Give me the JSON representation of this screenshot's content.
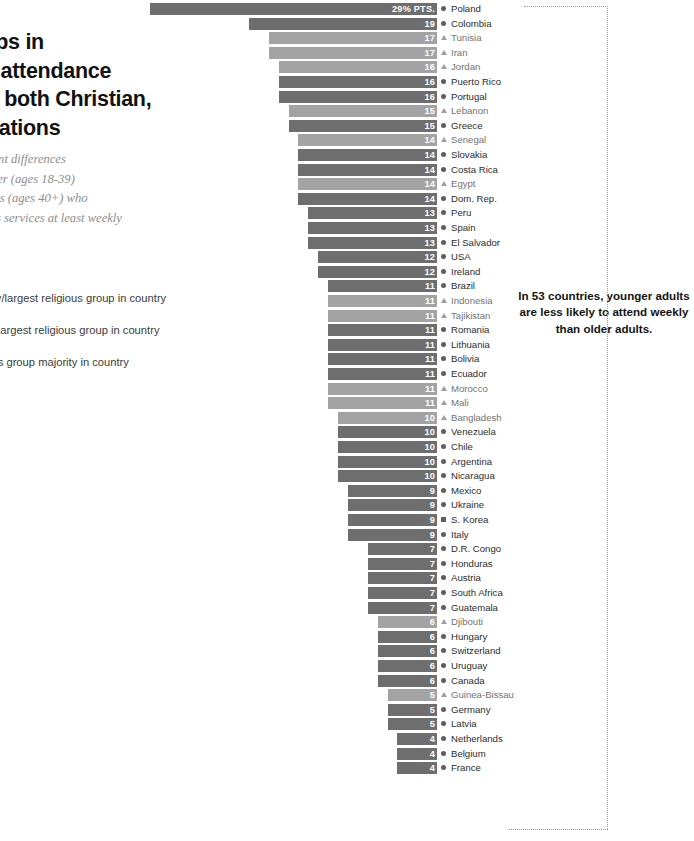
{
  "headline": {
    "title": "Large gaps in\nreligious attendance\nby age in both Christian,\nMuslim nations",
    "subtitle": "Percentage point differences\nbetween younger (ages 18-39)\nand older adults (ages 40+) who\nattend religious services at least weekly"
  },
  "legend": {
    "items": [
      {
        "marker": "circle",
        "label": "Christian majority/largest religious group in country"
      },
      {
        "marker": "triangle",
        "label": "Muslim majority/largest religious group in country"
      },
      {
        "marker": "square",
        "label": "Other/no religious group majority in country"
      }
    ]
  },
  "annotation": {
    "text": "In 53 countries, younger adults are less likely to attend weekly than older adults."
  },
  "colors": {
    "christian_bar": "#6e6e6e",
    "muslim_bar": "#a3a3a3",
    "other_bar": "#6e6e6e",
    "value_text": "#ffffff",
    "country_text": "#2d2d2d",
    "bracket": "#9a9a9a"
  },
  "chart_data": {
    "type": "bar",
    "title": "Large gaps in religious attendance by age in both Christian, Muslim nations",
    "xlabel": "Percentage point difference",
    "ylabel": "",
    "orientation": "horizontal",
    "grid": false,
    "value_suffix": "% PTS.",
    "top_value_label": "29% PTS.",
    "xlim": [
      0,
      29
    ],
    "legend_position": "left",
    "categories": [
      "Poland",
      "Colombia",
      "Tunisia",
      "Iran",
      "Jordan",
      "Puerto Rico",
      "Portugal",
      "Lebanon",
      "Greece",
      "Senegal",
      "Slovakia",
      "Costa Rica",
      "Egypt",
      "Dom. Rep.",
      "Peru",
      "Spain",
      "El Salvador",
      "USA",
      "Ireland",
      "Brazil",
      "Indonesia",
      "Tajikistan",
      "Romania",
      "Lithuania",
      "Bolivia",
      "Ecuador",
      "Morocco",
      "Mali",
      "Bangladesh",
      "Venezuela",
      "Chile",
      "Argentina",
      "Nicaragua",
      "Mexico",
      "Ukraine",
      "S. Korea",
      "Italy",
      "D.R. Congo",
      "Honduras",
      "Austria",
      "South Africa",
      "Guatemala",
      "Djibouti",
      "Hungary",
      "Switzerland",
      "Uruguay",
      "Canada",
      "Guinea-Bissau",
      "Germany",
      "Latvia",
      "Netherlands",
      "Belgium",
      "France"
    ],
    "values": [
      29,
      19,
      17,
      17,
      16,
      16,
      16,
      15,
      15,
      14,
      14,
      14,
      14,
      14,
      13,
      13,
      13,
      12,
      12,
      11,
      11,
      11,
      11,
      11,
      11,
      11,
      11,
      11,
      10,
      10,
      10,
      10,
      10,
      9,
      9,
      9,
      9,
      7,
      7,
      7,
      7,
      7,
      6,
      6,
      6,
      6,
      6,
      5,
      5,
      5,
      4,
      4,
      4
    ],
    "groups": [
      "christian",
      "christian",
      "muslim",
      "muslim",
      "muslim",
      "christian",
      "christian",
      "muslim",
      "christian",
      "muslim",
      "christian",
      "christian",
      "muslim",
      "christian",
      "christian",
      "christian",
      "christian",
      "christian",
      "christian",
      "christian",
      "muslim",
      "muslim",
      "christian",
      "christian",
      "christian",
      "christian",
      "muslim",
      "muslim",
      "muslim",
      "christian",
      "christian",
      "christian",
      "christian",
      "christian",
      "christian",
      "other",
      "christian",
      "christian",
      "christian",
      "christian",
      "christian",
      "christian",
      "muslim",
      "christian",
      "christian",
      "christian",
      "christian",
      "muslim",
      "christian",
      "christian",
      "christian",
      "christian",
      "christian"
    ]
  }
}
